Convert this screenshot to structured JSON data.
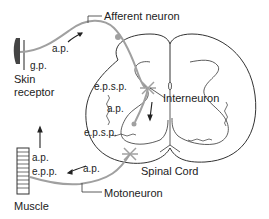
{
  "diagram": {
    "labels": {
      "afferent_neuron": "Afferent neuron",
      "interneuron": "Interneuron",
      "motoneuron": "Motoneuron",
      "spinal_cord": "Spinal Cord",
      "skin_receptor_line1": "Skin",
      "skin_receptor_line2": "receptor",
      "muscle": "Muscle",
      "gp": "g.p.",
      "ap_afferent": "a.p.",
      "epsp_upper": "e.p.s.p.",
      "ap_interneuron": "a.p.",
      "epsp_lower": "e.p.s.p.",
      "ap_motor": "a.p.",
      "ap_muscle": "a.p.",
      "epp": "e.p.p."
    },
    "colors": {
      "neuron": "#a0a0a0",
      "outline": "#333333",
      "text": "#222222"
    }
  }
}
